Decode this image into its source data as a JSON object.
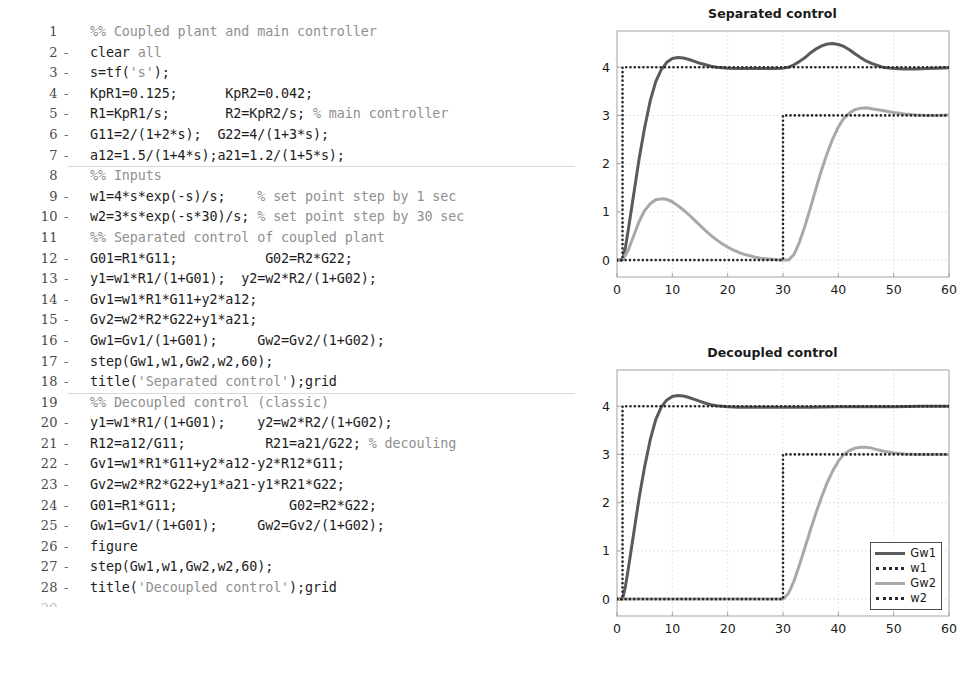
{
  "editor": {
    "name": "matlab-script-editor",
    "lines": [
      {
        "n": "1",
        "executable": false,
        "section_start": false,
        "tokens": [
          {
            "t": "%% Coupled plant and main controller",
            "c": "cm"
          }
        ]
      },
      {
        "n": "2",
        "executable": true,
        "section_start": false,
        "tokens": [
          {
            "t": "clear ",
            "c": "hl"
          },
          {
            "t": "all",
            "c": "kw"
          }
        ]
      },
      {
        "n": "3",
        "executable": true,
        "section_start": false,
        "tokens": [
          {
            "t": "s=tf(",
            "c": "hl"
          },
          {
            "t": "'s'",
            "c": "st"
          },
          {
            "t": ");",
            "c": "hl"
          }
        ]
      },
      {
        "n": "4",
        "executable": true,
        "section_start": false,
        "tokens": [
          {
            "t": "KpR1=0.125;      KpR2=0.042;",
            "c": "hl"
          }
        ]
      },
      {
        "n": "5",
        "executable": true,
        "section_start": false,
        "tokens": [
          {
            "t": "R1=KpR1/s;       R2=KpR2/s; ",
            "c": "hl"
          },
          {
            "t": "% main controller",
            "c": "cm"
          }
        ]
      },
      {
        "n": "6",
        "executable": true,
        "section_start": false,
        "tokens": [
          {
            "t": "G11=2/(1+2*s);  G22=4/(1+3*s);",
            "c": "hl"
          }
        ]
      },
      {
        "n": "7",
        "executable": true,
        "section_start": false,
        "tokens": [
          {
            "t": "a12=1.5/(1+4*s);a21=1.2/(1+5*s);",
            "c": "hl"
          }
        ]
      },
      {
        "n": "8",
        "executable": false,
        "section_start": true,
        "tokens": [
          {
            "t": "%% Inputs",
            "c": "cm"
          }
        ]
      },
      {
        "n": "9",
        "executable": true,
        "section_start": false,
        "tokens": [
          {
            "t": "w1=4*s*exp(-s)/s;    ",
            "c": "hl"
          },
          {
            "t": "% set point step by 1 sec",
            "c": "cm"
          }
        ]
      },
      {
        "n": "10",
        "executable": true,
        "section_start": false,
        "tokens": [
          {
            "t": "w2=3*s*exp(-s*30)/s; ",
            "c": "hl"
          },
          {
            "t": "% set point step by 30 sec",
            "c": "cm"
          }
        ]
      },
      {
        "n": "11",
        "executable": false,
        "section_start": false,
        "tokens": [
          {
            "t": "%% Separated control of coupled plant",
            "c": "cm"
          }
        ]
      },
      {
        "n": "12",
        "executable": true,
        "section_start": false,
        "tokens": [
          {
            "t": "G01=R1*G11;           G02=R2*G22;",
            "c": "hl"
          }
        ]
      },
      {
        "n": "13",
        "executable": true,
        "section_start": false,
        "tokens": [
          {
            "t": "y1=w1*R1/(1+G01);  y2=w2*R2/(1+G02);",
            "c": "hl"
          }
        ]
      },
      {
        "n": "14",
        "executable": true,
        "section_start": false,
        "tokens": [
          {
            "t": "Gv1=w1*R1*G11+y2*a12;",
            "c": "hl"
          }
        ]
      },
      {
        "n": "15",
        "executable": true,
        "section_start": false,
        "tokens": [
          {
            "t": "Gv2=w2*R2*G22+y1*a21;",
            "c": "hl"
          }
        ]
      },
      {
        "n": "16",
        "executable": true,
        "section_start": false,
        "tokens": [
          {
            "t": "Gw1=Gv1/(1+G01);     Gw2=Gv2/(1+G02);",
            "c": "hl"
          }
        ]
      },
      {
        "n": "17",
        "executable": true,
        "section_start": false,
        "tokens": [
          {
            "t": "step(Gw1,w1,Gw2,w2,60);",
            "c": "hl"
          }
        ]
      },
      {
        "n": "18",
        "executable": true,
        "section_start": false,
        "tokens": [
          {
            "t": "title(",
            "c": "hl"
          },
          {
            "t": "'Separated control'",
            "c": "st"
          },
          {
            "t": ");grid",
            "c": "hl"
          }
        ]
      },
      {
        "n": "19",
        "executable": false,
        "section_start": true,
        "tokens": [
          {
            "t": "%% Decoupled control (classic)",
            "c": "cm"
          }
        ]
      },
      {
        "n": "20",
        "executable": true,
        "section_start": false,
        "tokens": [
          {
            "t": "y1=w1*R1/(1+G01);    y2=w2*R2/(1+G02);",
            "c": "hl"
          }
        ]
      },
      {
        "n": "21",
        "executable": true,
        "section_start": false,
        "tokens": [
          {
            "t": "R12=a12/G11;          R21=a21/G22; ",
            "c": "hl"
          },
          {
            "t": "% decouling",
            "c": "cm"
          }
        ]
      },
      {
        "n": "22",
        "executable": true,
        "section_start": false,
        "tokens": [
          {
            "t": "Gv1=w1*R1*G11+y2*a12-y2*R12*G11;",
            "c": "hl"
          }
        ]
      },
      {
        "n": "23",
        "executable": true,
        "section_start": false,
        "tokens": [
          {
            "t": "Gv2=w2*R2*G22+y1*a21-y1*R21*G22;",
            "c": "hl"
          }
        ]
      },
      {
        "n": "24",
        "executable": true,
        "section_start": false,
        "tokens": [
          {
            "t": "G01=R1*G11;              G02=R2*G22;",
            "c": "hl"
          }
        ]
      },
      {
        "n": "25",
        "executable": true,
        "section_start": false,
        "tokens": [
          {
            "t": "Gw1=Gv1/(1+G01);     Gw2=Gv2/(1+G02);",
            "c": "hl"
          }
        ]
      },
      {
        "n": "26",
        "executable": true,
        "section_start": false,
        "tokens": [
          {
            "t": "figure",
            "c": "hl"
          }
        ]
      },
      {
        "n": "27",
        "executable": true,
        "section_start": false,
        "tokens": [
          {
            "t": "step(Gw1,w1,Gw2,w2,60);",
            "c": "hl"
          }
        ]
      },
      {
        "n": "28",
        "executable": true,
        "section_start": false,
        "tokens": [
          {
            "t": "title(",
            "c": "hl"
          },
          {
            "t": "'Decoupled control'",
            "c": "st"
          },
          {
            "t": ");grid",
            "c": "hl"
          }
        ]
      },
      {
        "n": "29",
        "executable": false,
        "section_start": false,
        "clipped": true,
        "tokens": [
          {
            "t": "",
            "c": "hl"
          }
        ]
      }
    ],
    "executable_marker": "-"
  },
  "colors": {
    "gw1": "#5a5a5a",
    "gw2": "#a8a8a8",
    "setpoint": "#2a2a2a",
    "grid": "#d0d0d0",
    "axis": "#9a9a9a",
    "text": "#1a1a1a"
  },
  "chart_data": [
    {
      "id": "separated-control",
      "type": "line",
      "title": "Separated control",
      "xlabel": "",
      "ylabel": "",
      "xlim": [
        0,
        60
      ],
      "ylim": [
        -0.35,
        4.75
      ],
      "xticks": [
        0,
        10,
        20,
        30,
        40,
        50,
        60
      ],
      "yticks": [
        0,
        1,
        2,
        3,
        4
      ],
      "grid": true,
      "legend": null,
      "series": [
        {
          "name": "Gw1",
          "style": "solid",
          "color": "#5a5a5a",
          "x": [
            0,
            1,
            1.5,
            2,
            3,
            4,
            5,
            6,
            7,
            8,
            9,
            10,
            11,
            12,
            13,
            14,
            15,
            16,
            17,
            18,
            19,
            20,
            22,
            24,
            26,
            28,
            30,
            31,
            32,
            33,
            34,
            35,
            36,
            37,
            38,
            39,
            40,
            41,
            42,
            43,
            44,
            45,
            46,
            48,
            50,
            52,
            54,
            56,
            58,
            60
          ],
          "y": [
            0,
            0,
            0.25,
            0.6,
            1.35,
            2.1,
            2.75,
            3.3,
            3.7,
            3.95,
            4.1,
            4.18,
            4.2,
            4.19,
            4.16,
            4.12,
            4.08,
            4.05,
            4.02,
            4.0,
            3.99,
            3.98,
            3.97,
            3.97,
            3.97,
            3.97,
            3.98,
            4.0,
            4.05,
            4.12,
            4.2,
            4.3,
            4.38,
            4.44,
            4.48,
            4.49,
            4.47,
            4.43,
            4.36,
            4.28,
            4.2,
            4.13,
            4.08,
            4.0,
            3.97,
            3.96,
            3.96,
            3.97,
            3.98,
            3.99
          ]
        },
        {
          "name": "w1",
          "style": "dotted",
          "color": "#2a2a2a",
          "x": [
            0,
            1,
            1,
            60
          ],
          "y": [
            0,
            0,
            4,
            4
          ]
        },
        {
          "name": "Gw2",
          "style": "solid",
          "color": "#a8a8a8",
          "x": [
            0,
            1,
            2,
            3,
            4,
            5,
            6,
            7,
            8,
            9,
            10,
            11,
            12,
            13,
            14,
            15,
            16,
            17,
            18,
            19,
            20,
            21,
            22,
            23,
            24,
            25,
            26,
            27,
            28,
            29,
            30,
            31,
            32,
            33,
            34,
            35,
            36,
            37,
            38,
            39,
            40,
            41,
            42,
            43,
            44,
            45,
            46,
            48,
            50,
            52,
            54,
            56,
            58,
            60
          ],
          "y": [
            0,
            0,
            0.2,
            0.5,
            0.8,
            1.03,
            1.17,
            1.25,
            1.27,
            1.26,
            1.21,
            1.13,
            1.04,
            0.94,
            0.83,
            0.72,
            0.61,
            0.51,
            0.42,
            0.34,
            0.27,
            0.21,
            0.16,
            0.12,
            0.09,
            0.06,
            0.04,
            0.03,
            0.02,
            0.01,
            0.0,
            0.0,
            0.12,
            0.38,
            0.72,
            1.1,
            1.5,
            1.88,
            2.22,
            2.52,
            2.76,
            2.94,
            3.05,
            3.12,
            3.15,
            3.16,
            3.14,
            3.1,
            3.06,
            3.03,
            3.01,
            3.0,
            3.0,
            3.01
          ]
        },
        {
          "name": "w2",
          "style": "dotted",
          "color": "#2a2a2a",
          "x": [
            0,
            30,
            30,
            60
          ],
          "y": [
            0,
            0,
            3,
            3
          ]
        }
      ]
    },
    {
      "id": "decoupled-control",
      "type": "line",
      "title": "Decoupled control",
      "xlabel": "",
      "ylabel": "",
      "xlim": [
        0,
        60
      ],
      "ylim": [
        -0.35,
        4.75
      ],
      "xticks": [
        0,
        10,
        20,
        30,
        40,
        50,
        60
      ],
      "yticks": [
        0,
        1,
        2,
        3,
        4
      ],
      "grid": true,
      "legend": {
        "position": "lower-right",
        "entries": [
          {
            "label": "Gw1",
            "style": "solid",
            "color": "#5a5a5a"
          },
          {
            "label": "w1",
            "style": "dotted",
            "color": "#2a2a2a"
          },
          {
            "label": "Gw2",
            "style": "solid",
            "color": "#a8a8a8"
          },
          {
            "label": "w2",
            "style": "dotted",
            "color": "#2a2a2a"
          }
        ]
      },
      "series": [
        {
          "name": "Gw1",
          "style": "solid",
          "color": "#5a5a5a",
          "x": [
            0,
            1,
            1.5,
            2,
            3,
            4,
            5,
            6,
            7,
            8,
            9,
            10,
            11,
            12,
            13,
            14,
            15,
            16,
            17,
            18,
            19,
            20,
            22,
            25,
            30,
            35,
            40,
            45,
            50,
            55,
            60
          ],
          "y": [
            0,
            0,
            0.25,
            0.6,
            1.35,
            2.1,
            2.75,
            3.3,
            3.72,
            3.98,
            4.13,
            4.2,
            4.22,
            4.21,
            4.18,
            4.14,
            4.1,
            4.06,
            4.03,
            4.01,
            4.0,
            3.99,
            3.98,
            3.98,
            3.98,
            3.98,
            3.99,
            3.99,
            3.99,
            4.0,
            4.0
          ]
        },
        {
          "name": "w1",
          "style": "dotted",
          "color": "#2a2a2a",
          "x": [
            0,
            1,
            1,
            60
          ],
          "y": [
            0,
            0,
            4,
            4
          ]
        },
        {
          "name": "Gw2",
          "style": "solid",
          "color": "#a8a8a8",
          "x": [
            0,
            30,
            31,
            32,
            33,
            34,
            35,
            36,
            37,
            38,
            39,
            40,
            41,
            42,
            43,
            44,
            45,
            46,
            47,
            48,
            50,
            52,
            54,
            56,
            58,
            60
          ],
          "y": [
            0,
            0,
            0.12,
            0.38,
            0.72,
            1.08,
            1.45,
            1.8,
            2.12,
            2.42,
            2.66,
            2.86,
            3.0,
            3.08,
            3.13,
            3.15,
            3.15,
            3.13,
            3.1,
            3.07,
            3.03,
            3.01,
            3.0,
            3.0,
            3.0,
            3.0
          ]
        },
        {
          "name": "w2",
          "style": "dotted",
          "color": "#2a2a2a",
          "x": [
            0,
            30,
            30,
            60
          ],
          "y": [
            0,
            0,
            3,
            3
          ]
        }
      ]
    }
  ]
}
